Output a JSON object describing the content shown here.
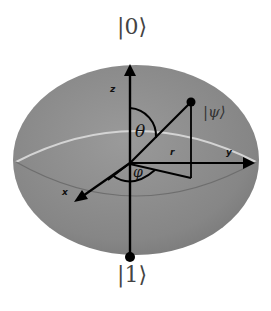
{
  "diagram": {
    "type": "bloch-sphere",
    "labels": {
      "north_state": "|0⟩",
      "south_state": "|1⟩",
      "state": "|ψ⟩",
      "axis_z": "z",
      "axis_x": "x",
      "axis_y": "y",
      "polar_angle": "θ",
      "azimuth_angle": "φ",
      "radius": "r"
    },
    "colors": {
      "sphere": "#8a8a8a",
      "equator": "#cfcfcf",
      "lines": "#000000"
    }
  }
}
